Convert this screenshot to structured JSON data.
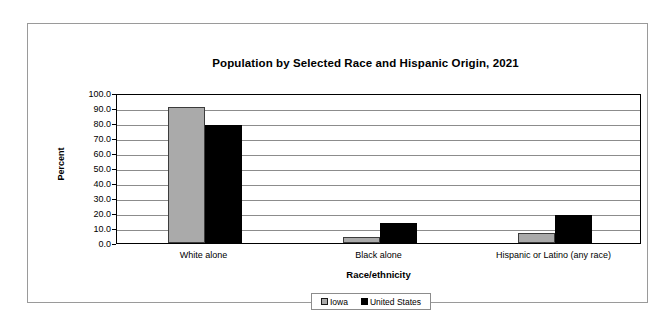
{
  "chart_data": {
    "type": "bar",
    "title": "Population by Selected Race and Hispanic Origin, 2021",
    "xlabel": "Race/ethnicity",
    "ylabel": "Percent",
    "ylim": [
      0,
      100
    ],
    "ytick_step": 10,
    "grid": true,
    "legend_position": "bottom",
    "categories": [
      "White alone",
      "Black alone",
      "Hispanic or Latino (any race)"
    ],
    "ytick_labels": [
      "100.0",
      "90.0",
      "80.0",
      "70.0",
      "60.0",
      "50.0",
      "40.0",
      "30.0",
      "20.0",
      "10.0",
      "0.0"
    ],
    "series": [
      {
        "name": "Iowa",
        "color": "#aaaaaa",
        "values": [
          90.6,
          4.1,
          6.8
        ]
      },
      {
        "name": "United States",
        "color": "#000000",
        "values": [
          78.5,
          13.6,
          18.9
        ]
      }
    ]
  }
}
